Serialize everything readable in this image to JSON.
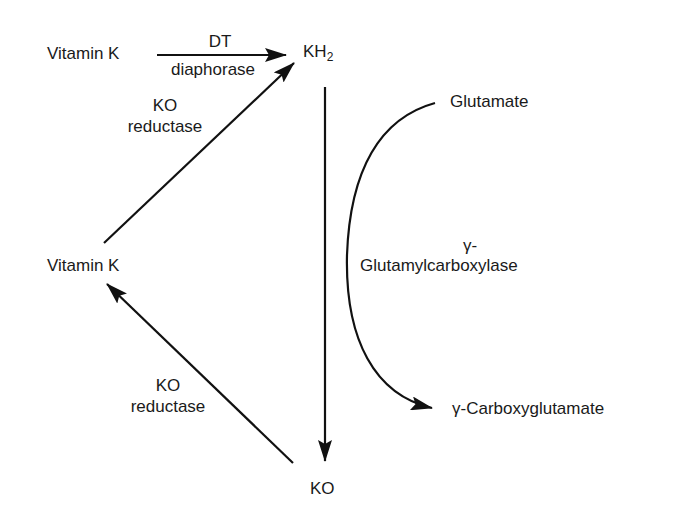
{
  "diagram": {
    "nodes": {
      "vitamin_k_top": "Vitamin K",
      "kh2_main": "KH",
      "kh2_sub": "2",
      "vitamin_k_left": "Vitamin K",
      "ko": "KO",
      "glutamate": "Glutamate",
      "carboxyglutamate": "γ-Carboxyglutamate"
    },
    "edges": {
      "dt_diaphorase": {
        "line1": "DT",
        "line2": "diaphorase"
      },
      "ko_reductase_top": {
        "line1": "KO",
        "line2": "reductase"
      },
      "ko_reductase_bottom": {
        "line1": "KO",
        "line2": "reductase"
      },
      "carboxylase": {
        "line1": "γ-",
        "line2": "Glutamylcarboxylase"
      }
    },
    "colors": {
      "stroke": "#111111",
      "text": "#1a1a1a",
      "background": "#ffffff"
    }
  }
}
